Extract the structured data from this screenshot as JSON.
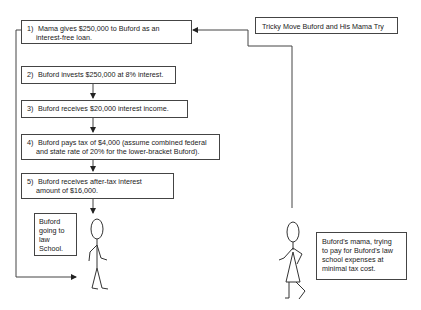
{
  "title": "Tricky Move Buford and His Mama Try",
  "steps": [
    {
      "num": "1)",
      "line1": "Mama gives $250,000 to Buford as an",
      "line2": "interest-free loan."
    },
    {
      "num": "2)",
      "line1": "Buford invests $250,000 at 8% interest.",
      "line2": ""
    },
    {
      "num": "3)",
      "line1": "Buford receives $20,000 interest income.",
      "line2": ""
    },
    {
      "num": "4)",
      "line1": "Buford pays tax of $4,000 (assume combined federal",
      "line2": "and state rate of 20% for the lower-bracket Buford)."
    },
    {
      "num": "5)",
      "line1": "Buford receives after-tax interest",
      "line2": "amount of $16,000."
    }
  ],
  "buford_caption": [
    "Buford",
    "going to",
    "law",
    "School."
  ],
  "mama_caption": [
    "Buford's mama, trying",
    "to pay for Buford's law",
    "school expenses at",
    "minimal tax cost."
  ]
}
